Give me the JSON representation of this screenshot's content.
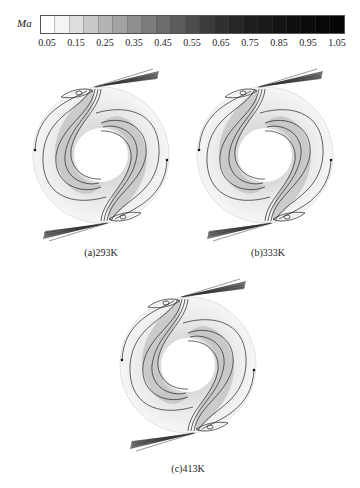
{
  "colorbar": {
    "variable": "Ma",
    "ticks": [
      "0.05",
      "0.15",
      "0.25",
      "0.35",
      "0.45",
      "0.55",
      "0.65",
      "0.75",
      "0.85",
      "0.95",
      "1.05"
    ],
    "segment_colors": [
      "#ffffff",
      "#f4f4f4",
      "#dedede",
      "#c8c8c8",
      "#b4b4b4",
      "#a2a2a2",
      "#8e8e8e",
      "#7c7c7c",
      "#6c6c6c",
      "#5c5c5c",
      "#4c4c4c",
      "#3c3c3c",
      "#303030",
      "#262626",
      "#1e1e1e",
      "#191919",
      "#141414",
      "#101010",
      "#0c0c0c",
      "#080808",
      "#050505"
    ]
  },
  "panels": [
    {
      "id": "a",
      "caption": "(a)293K",
      "temperature_K": 293
    },
    {
      "id": "b",
      "caption": "(b)333K",
      "temperature_K": 333
    },
    {
      "id": "c",
      "caption": "(c)413K",
      "temperature_K": 413
    }
  ]
}
